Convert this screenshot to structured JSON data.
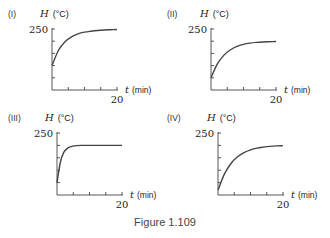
{
  "caption": "Figure 1.109",
  "chart_data": [
    {
      "type": "line",
      "panel": "(I)",
      "ylabel_var": "H",
      "ylabel_unit": "(°C)",
      "xlabel_var": "t",
      "xlabel_unit": "(min)",
      "ytick_label": "250",
      "xtick_label": "20",
      "xlim": [
        0,
        20
      ],
      "ylim": [
        0,
        250
      ],
      "x": [
        0,
        2,
        4,
        6,
        8,
        10,
        12,
        14,
        16,
        18,
        20
      ],
      "values": [
        100,
        163,
        198,
        218,
        230,
        237,
        241,
        244,
        246,
        247,
        248
      ],
      "description": "starts at ~100, rises to level off near 250"
    },
    {
      "type": "line",
      "panel": "(II)",
      "ylabel_var": "H",
      "ylabel_unit": "(°C)",
      "xlabel_var": "t",
      "xlabel_unit": "(min)",
      "ytick_label": "250",
      "xtick_label": "20",
      "xlim": [
        0,
        20
      ],
      "ylim": [
        0,
        250
      ],
      "x": [
        0,
        2,
        4,
        6,
        8,
        10,
        12,
        14,
        16,
        18,
        20
      ],
      "values": [
        50,
        108,
        143,
        165,
        179,
        187,
        192,
        195,
        197,
        198,
        199
      ],
      "description": "starts at ~50, rises to level off near 200"
    },
    {
      "type": "line",
      "panel": "(III)",
      "ylabel_var": "H",
      "ylabel_unit": "(°C)",
      "xlabel_var": "t",
      "xlabel_unit": "(min)",
      "ytick_label": "250",
      "xtick_label": "20",
      "xlim": [
        0,
        20
      ],
      "ylim": [
        0,
        250
      ],
      "x": [
        0,
        1,
        2,
        3,
        4,
        6,
        8,
        10,
        12,
        14,
        16,
        18,
        20
      ],
      "values": [
        50,
        130,
        170,
        186,
        194,
        199,
        200,
        200,
        200,
        200,
        200,
        200,
        200
      ],
      "description": "starts at ~50, rises rapidly to level off at 200"
    },
    {
      "type": "line",
      "panel": "(IV)",
      "ylabel_var": "H",
      "ylabel_unit": "(°C)",
      "xlabel_var": "t",
      "xlabel_unit": "(min)",
      "ytick_label": "250",
      "xtick_label": "20",
      "xlim": [
        0,
        20
      ],
      "ylim": [
        0,
        250
      ],
      "x": [
        0,
        2,
        4,
        6,
        8,
        10,
        12,
        14,
        16,
        18,
        20
      ],
      "values": [
        20,
        85,
        127,
        154,
        171,
        182,
        189,
        193,
        196,
        198,
        199
      ],
      "description": "starts at ~20, rises to level off near 200"
    }
  ]
}
